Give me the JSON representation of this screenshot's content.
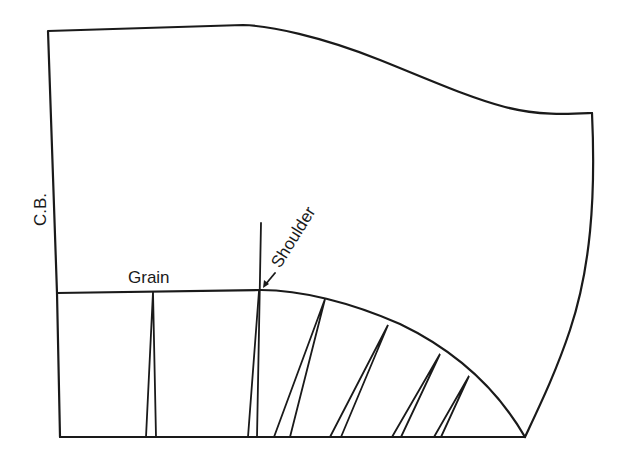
{
  "diagram": {
    "type": "pattern-drafting",
    "labels": {
      "center_back": "C.B.",
      "grain": "Grain",
      "shoulder": "Shoulder"
    },
    "stroke_color": "#1a1a1a",
    "background_color": "#ffffff",
    "wedge_count": 6
  }
}
